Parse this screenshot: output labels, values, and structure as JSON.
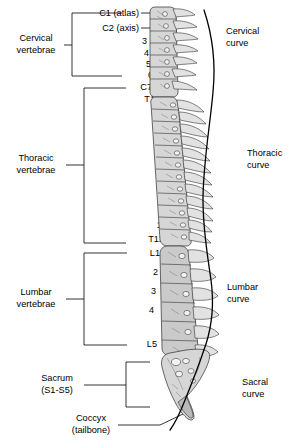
{
  "figure": {
    "colors": {
      "line": "#000000",
      "bone_fill": "#d6d6d6",
      "bone_outline": "#2b2b2b",
      "background": "#ffffff"
    }
  },
  "left_groups": [
    {
      "id": "cervical",
      "label_line1": "Cervical",
      "label_line2": "vertebrae"
    },
    {
      "id": "thoracic",
      "label_line1": "Thoracic",
      "label_line2": "vertebrae"
    },
    {
      "id": "lumbar",
      "label_line1": "Lumbar",
      "label_line2": "vertebrae"
    },
    {
      "id": "sacrum",
      "label_line1": "Sacrum",
      "label_line2": "(S1-S5)"
    },
    {
      "id": "coccyx",
      "label_line1": "Coccyx",
      "label_line2": "(tailbone)"
    }
  ],
  "vertebra_labels": {
    "cervical": [
      "C1 (atlas)",
      "C2 (axis)",
      "3",
      "4",
      "5",
      "6",
      "C7"
    ],
    "thoracic": [
      "T1",
      "2",
      "3",
      "4",
      "5",
      "6",
      "7",
      "8",
      "9",
      "10",
      "11",
      "T12"
    ],
    "lumbar": [
      "L1",
      "2",
      "3",
      "4",
      "L5"
    ]
  },
  "curves": [
    {
      "id": "cervical-curve",
      "label_line1": "Cervical",
      "label_line2": "curve"
    },
    {
      "id": "thoracic-curve",
      "label_line1": "Thoracic",
      "label_line2": "curve"
    },
    {
      "id": "lumbar-curve",
      "label_line1": "Lumbar",
      "label_line2": "curve"
    },
    {
      "id": "sacral-curve",
      "label_line1": "Sacral",
      "label_line2": "curve"
    }
  ]
}
